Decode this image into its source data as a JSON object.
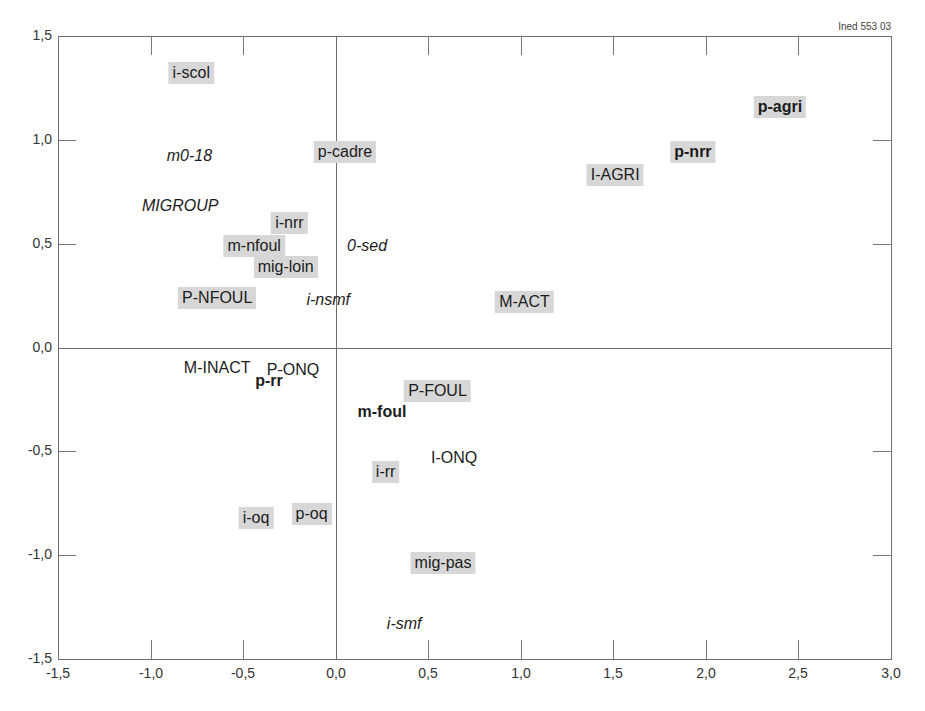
{
  "source_label": "Ined 553 03",
  "chart_data": {
    "type": "scatter",
    "title": "",
    "xlabel": "",
    "ylabel": "",
    "xlim": [
      -1.5,
      3.0
    ],
    "ylim": [
      -1.5,
      1.5
    ],
    "grid": false,
    "reference_lines": {
      "x": 0.0,
      "y": 0.0
    },
    "x_ticks": [
      "-1,5",
      "-1,0",
      "-0,5",
      "0,0",
      "0,5",
      "1,0",
      "1,5",
      "2,0",
      "2,5",
      "3,0"
    ],
    "y_ticks": [
      "1,5",
      "1,0",
      "0,5",
      "0,0",
      "-0,5",
      "-1,0",
      "-1,5"
    ],
    "points": [
      {
        "label": "i-scol",
        "x": -0.78,
        "y": 1.32,
        "style": "boxed"
      },
      {
        "label": "m0-18",
        "x": -0.79,
        "y": 0.92,
        "style": "italic"
      },
      {
        "label": "MIGROUP",
        "x": -0.84,
        "y": 0.68,
        "style": "italic"
      },
      {
        "label": "p-cadre",
        "x": 0.05,
        "y": 0.94,
        "style": "boxed"
      },
      {
        "label": "i-nrr",
        "x": -0.25,
        "y": 0.6,
        "style": "boxed"
      },
      {
        "label": "m-nfoul",
        "x": -0.44,
        "y": 0.49,
        "style": "boxed"
      },
      {
        "label": "mig-loin",
        "x": -0.27,
        "y": 0.39,
        "style": "boxed"
      },
      {
        "label": "0-sed",
        "x": 0.17,
        "y": 0.49,
        "style": "italic"
      },
      {
        "label": "P-NFOUL",
        "x": -0.64,
        "y": 0.24,
        "style": "boxed"
      },
      {
        "label": "i-nsmf",
        "x": -0.04,
        "y": 0.23,
        "style": "italic"
      },
      {
        "label": "M-ACT",
        "x": 1.02,
        "y": 0.22,
        "style": "boxed"
      },
      {
        "label": "I-AGRI",
        "x": 1.51,
        "y": 0.83,
        "style": "boxed"
      },
      {
        "label": "p-nrr",
        "x": 1.93,
        "y": 0.94,
        "style": "boxed bold"
      },
      {
        "label": "p-agri",
        "x": 2.4,
        "y": 1.16,
        "style": "boxed bold"
      },
      {
        "label": "M-INACT",
        "x": -0.64,
        "y": -0.1,
        "style": "plain"
      },
      {
        "label": "P-ONQ",
        "x": -0.23,
        "y": -0.11,
        "style": "plain"
      },
      {
        "label": "p-rr",
        "x": -0.36,
        "y": -0.16,
        "style": "bold"
      },
      {
        "label": "P-FOUL",
        "x": 0.55,
        "y": -0.21,
        "style": "boxed"
      },
      {
        "label": "m-foul",
        "x": 0.25,
        "y": -0.31,
        "style": "bold"
      },
      {
        "label": "I-ONQ",
        "x": 0.64,
        "y": -0.53,
        "style": "plain"
      },
      {
        "label": "i-rr",
        "x": 0.27,
        "y": -0.6,
        "style": "boxed"
      },
      {
        "label": "i-oq",
        "x": -0.43,
        "y": -0.82,
        "style": "boxed"
      },
      {
        "label": "p-oq",
        "x": -0.13,
        "y": -0.8,
        "style": "boxed"
      },
      {
        "label": "mig-pas",
        "x": 0.58,
        "y": -1.04,
        "style": "boxed"
      },
      {
        "label": "i-smf",
        "x": 0.37,
        "y": -1.33,
        "style": "italic"
      }
    ]
  }
}
